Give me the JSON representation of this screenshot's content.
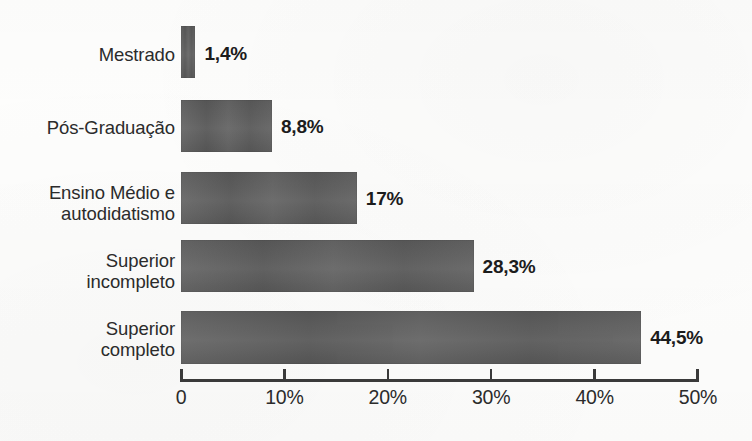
{
  "chart_data": {
    "type": "bar",
    "orientation": "horizontal",
    "title": "",
    "subtitle": "",
    "xlabel": "",
    "ylabel": "",
    "xlim": [
      0,
      50
    ],
    "grid": false,
    "legend": null,
    "categories": [
      "Mestrado",
      "Pós-Graduação",
      "Ensino Médio e\nautodidatismo",
      "Superior\nincompleto",
      "Superior\ncompleto"
    ],
    "values": [
      1.4,
      8.8,
      17,
      28.3,
      44.5
    ],
    "value_labels": [
      "1,4%",
      "8,8%",
      "17%",
      "28,3%",
      "44,5%"
    ],
    "tick_values": [
      0,
      10,
      20,
      30,
      40,
      50
    ],
    "tick_labels": [
      "0",
      "10%",
      "20%",
      "30%",
      "40%",
      "50%"
    ],
    "bar_color": "#5e5e5e",
    "text_color": "#2b2b2b",
    "axis_color": "#3a3a3a",
    "background_color": "#fdfdfc"
  },
  "bars": [
    {
      "category": "Mestrado",
      "label": "Mestrado",
      "value": 1.4,
      "value_label": "1,4%"
    },
    {
      "category": "Pós-Graduação",
      "label": "Pós-Graduação",
      "value": 8.8,
      "value_label": "8,8%"
    },
    {
      "category": "Ensino Médio e autodidatismo",
      "label": "Ensino Médio e\nautodidatismo",
      "value": 17,
      "value_label": "17%"
    },
    {
      "category": "Superior incompleto",
      "label": "Superior\nincompleto",
      "value": 28.3,
      "value_label": "28,3%"
    },
    {
      "category": "Superior completo",
      "label": "Superior\ncompleto",
      "value": 44.5,
      "value_label": "44,5%"
    }
  ],
  "axis": {
    "ticks": [
      {
        "label": "0",
        "value": 0
      },
      {
        "label": "10%",
        "value": 10
      },
      {
        "label": "20%",
        "value": 20
      },
      {
        "label": "30%",
        "value": 30
      },
      {
        "label": "40%",
        "value": 40
      },
      {
        "label": "50%",
        "value": 50
      }
    ]
  },
  "source": {
    "text": ""
  }
}
